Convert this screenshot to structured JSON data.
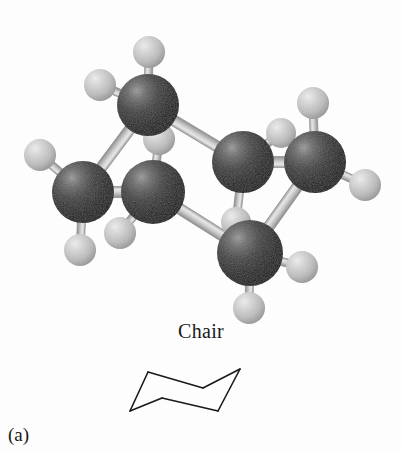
{
  "figure": {
    "caption_label": "(a)",
    "conformation_label": "Chair"
  },
  "colors": {
    "carbon": "#3a3a3a",
    "carbon_dark": "#111111",
    "carbon_highlight": "#8a8a8a",
    "hydrogen": "#c9c9c9",
    "hydrogen_dark": "#9a9a9a",
    "hydrogen_highlight": "#f2f2f2",
    "bond": "#d0d0d0",
    "bond_edge": "#8d8d8d",
    "line": "#1a1a1a",
    "background": "#ffffff"
  },
  "model": {
    "atom_label_carbon": "C",
    "atom_label_hydrogen": "H",
    "carbon_count": 6,
    "hydrogen_count": 12,
    "carbons": [
      {
        "name": "carbon-1",
        "x": 148,
        "y": 105,
        "r": 31
      },
      {
        "name": "carbon-2",
        "x": 83,
        "y": 192,
        "r": 31
      },
      {
        "name": "carbon-3",
        "x": 153,
        "y": 192,
        "r": 32
      },
      {
        "name": "carbon-4",
        "x": 243,
        "y": 162,
        "r": 31
      },
      {
        "name": "carbon-5",
        "x": 315,
        "y": 162,
        "r": 31
      },
      {
        "name": "carbon-6",
        "x": 250,
        "y": 253,
        "r": 33
      }
    ],
    "hydrogens": [
      {
        "name": "hydrogen-1a",
        "x": 149,
        "y": 52,
        "r": 16
      },
      {
        "name": "hydrogen-1b",
        "x": 100,
        "y": 85,
        "r": 16
      },
      {
        "name": "hydrogen-2a",
        "x": 40,
        "y": 155,
        "r": 16
      },
      {
        "name": "hydrogen-2b",
        "x": 80,
        "y": 250,
        "r": 16
      },
      {
        "name": "hydrogen-3a",
        "x": 159,
        "y": 139,
        "r": 16
      },
      {
        "name": "hydrogen-3b",
        "x": 120,
        "y": 233,
        "r": 16
      },
      {
        "name": "hydrogen-4a",
        "x": 281,
        "y": 133,
        "r": 15
      },
      {
        "name": "hydrogen-4b",
        "x": 236,
        "y": 222,
        "r": 15
      },
      {
        "name": "hydrogen-5a",
        "x": 313,
        "y": 103,
        "r": 16
      },
      {
        "name": "hydrogen-5b",
        "x": 365,
        "y": 185,
        "r": 16
      },
      {
        "name": "hydrogen-6a",
        "x": 302,
        "y": 267,
        "r": 16
      },
      {
        "name": "hydrogen-6b",
        "x": 249,
        "y": 308,
        "r": 16
      }
    ],
    "cc_bonds": [
      {
        "name": "bond-c1-c2",
        "from": [
          148,
          105
        ],
        "to": [
          83,
          192
        ]
      },
      {
        "name": "bond-c2-c3",
        "from": [
          83,
          192
        ],
        "to": [
          153,
          192
        ]
      },
      {
        "name": "bond-c3-c6",
        "from": [
          153,
          192
        ],
        "to": [
          250,
          253
        ]
      },
      {
        "name": "bond-c6-c5",
        "from": [
          250,
          253
        ],
        "to": [
          315,
          162
        ]
      },
      {
        "name": "bond-c5-c4",
        "from": [
          315,
          162
        ],
        "to": [
          243,
          162
        ]
      },
      {
        "name": "bond-c4-c1",
        "from": [
          243,
          162
        ],
        "to": [
          148,
          105
        ]
      }
    ],
    "ch_bonds": [
      {
        "name": "bond-c1-h1a",
        "from": [
          148,
          105
        ],
        "to": [
          149,
          52
        ]
      },
      {
        "name": "bond-c1-h1b",
        "from": [
          148,
          105
        ],
        "to": [
          100,
          85
        ]
      },
      {
        "name": "bond-c2-h2a",
        "from": [
          83,
          192
        ],
        "to": [
          40,
          155
        ]
      },
      {
        "name": "bond-c2-h2b",
        "from": [
          83,
          192
        ],
        "to": [
          80,
          250
        ]
      },
      {
        "name": "bond-c3-h3a",
        "from": [
          153,
          192
        ],
        "to": [
          159,
          139
        ]
      },
      {
        "name": "bond-c3-h3b",
        "from": [
          153,
          192
        ],
        "to": [
          120,
          233
        ]
      },
      {
        "name": "bond-c4-h4a",
        "from": [
          243,
          162
        ],
        "to": [
          281,
          133
        ]
      },
      {
        "name": "bond-c4-h4b",
        "from": [
          243,
          162
        ],
        "to": [
          236,
          222
        ]
      },
      {
        "name": "bond-c5-h5a",
        "from": [
          315,
          162
        ],
        "to": [
          313,
          103
        ]
      },
      {
        "name": "bond-c5-h5b",
        "from": [
          315,
          162
        ],
        "to": [
          365,
          185
        ]
      },
      {
        "name": "bond-c6-h6a",
        "from": [
          250,
          253
        ],
        "to": [
          302,
          267
        ]
      },
      {
        "name": "bond-c6-h6b",
        "from": [
          250,
          253
        ],
        "to": [
          249,
          308
        ]
      }
    ]
  },
  "skeleton": {
    "name": "chair-line-drawing",
    "stroke_width": 1.6,
    "vertices": [
      {
        "name": "vertex-upper-left",
        "x": 38,
        "y": 20
      },
      {
        "name": "vertex-upper-right",
        "x": 130,
        "y": 17
      },
      {
        "name": "vertex-mid-right",
        "x": 93,
        "y": 36
      },
      {
        "name": "vertex-mid-left",
        "x": 52,
        "y": 46
      },
      {
        "name": "vertex-lower-left",
        "x": 20,
        "y": 59
      },
      {
        "name": "vertex-lower-right",
        "x": 108,
        "y": 59
      }
    ],
    "edges": [
      [
        "vertex-upper-left",
        "vertex-mid-right"
      ],
      [
        "vertex-mid-right",
        "vertex-upper-right"
      ],
      [
        "vertex-upper-right",
        "vertex-lower-right"
      ],
      [
        "vertex-lower-right",
        "vertex-mid-left"
      ],
      [
        "vertex-mid-left",
        "vertex-lower-left"
      ],
      [
        "vertex-lower-left",
        "vertex-upper-left"
      ]
    ]
  }
}
